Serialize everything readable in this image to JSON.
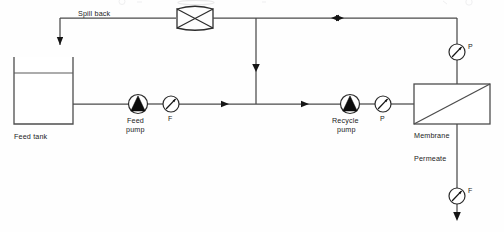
{
  "diagram": {
    "background_color": "#fefefe",
    "line_color": "#4a4a4a",
    "text_color": "#1b1b1b",
    "width": 504,
    "height": 232
  },
  "labels": {
    "spill_back": "Spill back",
    "feed_tank": "Feed tank",
    "feed_pump_line1": "Feed",
    "feed_pump_line2": "pump",
    "recycle_pump_line1": "Recycle",
    "recycle_pump_line2": "pump",
    "membrane": "Membrane",
    "permeate": "Permeate"
  },
  "instruments": [
    {
      "id": "feed-flow-meter",
      "tag": "F",
      "type": "flow-indicator",
      "x": 171,
      "y": 104
    },
    {
      "id": "recycle-pressure-gauge",
      "tag": "P",
      "type": "pressure-indicator",
      "x": 383,
      "y": 104
    },
    {
      "id": "retentate-pressure-gauge",
      "tag": "P",
      "type": "pressure-indicator",
      "x": 457,
      "y": 52
    },
    {
      "id": "permeate-flow-meter",
      "tag": "F",
      "type": "flow-indicator",
      "x": 457,
      "y": 196
    }
  ],
  "equipment": [
    {
      "id": "feed-tank",
      "name": "Feed tank",
      "type": "open-tank"
    },
    {
      "id": "feed-pump",
      "name": "Feed pump",
      "type": "centrifugal-pump"
    },
    {
      "id": "recycle-pump",
      "name": "Recycle pump",
      "type": "centrifugal-pump"
    },
    {
      "id": "control-valve",
      "name": "Spill back valve",
      "type": "butterfly-valve"
    },
    {
      "id": "membrane-module",
      "name": "Membrane",
      "type": "membrane-module"
    }
  ],
  "streams": [
    {
      "id": "feed-line",
      "from": "feed-tank",
      "to": "feed-pump",
      "label": ""
    },
    {
      "id": "spill-back-line",
      "from": "control-valve",
      "to": "feed-tank",
      "label": "Spill back"
    },
    {
      "id": "recycle-line",
      "from": "membrane-module",
      "to": "control-valve",
      "label": ""
    },
    {
      "id": "permeate-line",
      "from": "membrane-module",
      "to": "permeate-outlet",
      "label": "Permeate"
    }
  ],
  "ghost": {
    "top_artifact": ""
  }
}
